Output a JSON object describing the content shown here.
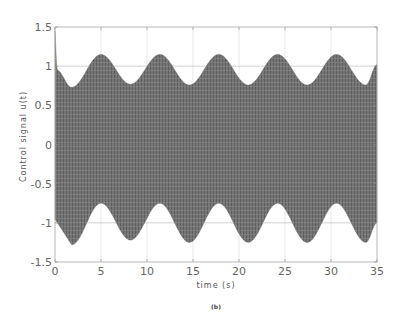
{
  "chart_data": {
    "type": "area",
    "title": "",
    "caption": "(b)",
    "xlabel": "time (s)",
    "ylabel": "Control signal u(t)",
    "xlim": [
      0,
      35
    ],
    "ylim": [
      -1.5,
      1.5
    ],
    "xticks": [
      0,
      5,
      10,
      15,
      20,
      25,
      30,
      35
    ],
    "yticks": [
      1.5,
      1,
      0.5,
      0,
      -0.5,
      -1,
      -1.5
    ],
    "xtick_labels": [
      "0",
      "5",
      "10",
      "15",
      "20",
      "25",
      "30",
      "35"
    ],
    "ytick_labels": [
      "1.5",
      "1",
      "0.5",
      "0",
      "-0.5",
      "-1",
      "-1.5"
    ],
    "grid": true,
    "legend": null,
    "series": [
      {
        "name": "upper envelope",
        "x": [
          0,
          0.2,
          1.8,
          5.0,
          8.2,
          11.4,
          14.6,
          17.8,
          21.0,
          24.2,
          27.4,
          30.6,
          33.8,
          35
        ],
        "values": [
          1.45,
          0.95,
          0.73,
          1.15,
          0.77,
          1.15,
          0.76,
          1.15,
          0.76,
          1.15,
          0.76,
          1.15,
          0.76,
          1.02
        ]
      },
      {
        "name": "lower envelope",
        "x": [
          0,
          1.8,
          5.0,
          8.2,
          11.4,
          14.6,
          17.8,
          21.0,
          24.2,
          27.4,
          30.6,
          33.8,
          35
        ],
        "values": [
          -0.95,
          -1.28,
          -0.75,
          -1.22,
          -0.75,
          -1.25,
          -0.75,
          -1.25,
          -0.75,
          -1.25,
          -0.75,
          -1.25,
          -1.0
        ]
      }
    ],
    "colors": {
      "band": "#6e6e6e",
      "grid": "#d9d9d9",
      "axis": "#b0b0b0"
    }
  }
}
